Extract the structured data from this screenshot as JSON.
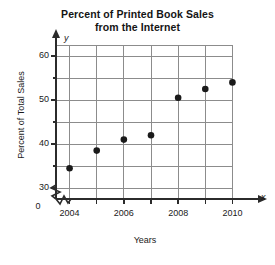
{
  "chart_data": {
    "type": "scatter",
    "title": "Percent of Printed Book Sales from the Internet",
    "title_line1": "Percent of Printed Book Sales",
    "title_line2": "from the Internet",
    "xlabel": "Years",
    "ylabel": "Percent of Total Sales",
    "x_axis_letter": "x",
    "y_axis_letter": "y",
    "origin_label": "0",
    "x": [
      2004,
      2005,
      2006,
      2007,
      2008,
      2009,
      2010
    ],
    "values": [
      34.5,
      38.5,
      41,
      42,
      50.5,
      52.5,
      54
    ],
    "points": [
      {
        "x": 2004,
        "y": 34.5
      },
      {
        "x": 2005,
        "y": 38.5
      },
      {
        "x": 2006,
        "y": 41
      },
      {
        "x": 2007,
        "y": 42
      },
      {
        "x": 2008,
        "y": 50.5
      },
      {
        "x": 2009,
        "y": 52.5
      },
      {
        "x": 2010,
        "y": 54
      }
    ],
    "xlim": [
      2003.5,
      2010.5
    ],
    "ylim": [
      27.5,
      62.5
    ],
    "xticks": [
      2004,
      2005,
      2006,
      2007,
      2008,
      2009,
      2010
    ],
    "xtick_labels": [
      "2004",
      "",
      "2006",
      "",
      "2008",
      "",
      "2010"
    ],
    "yticks": [
      30,
      35,
      40,
      45,
      50,
      55,
      60
    ],
    "ytick_labels": [
      "30",
      "",
      "40",
      "",
      "50",
      "",
      "60"
    ],
    "grid": true,
    "legend": "none",
    "axis_break_x": true,
    "axis_break_y": true,
    "marker_color": "#1a1a1a",
    "grid_color": "#8c8c8c",
    "axis_color": "#2b2b2b"
  }
}
